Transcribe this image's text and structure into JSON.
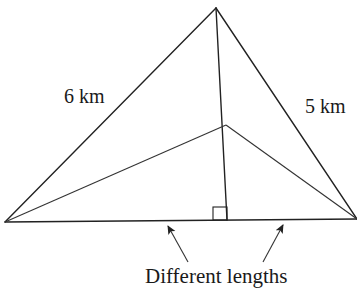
{
  "diagram": {
    "type": "geometry-triangle",
    "stroke_color": "#222222",
    "background": "#ffffff",
    "vertices": {
      "apex": [
        216,
        8
      ],
      "left": [
        5,
        222
      ],
      "right": [
        357,
        219
      ],
      "interior": [
        226,
        125
      ],
      "foot": [
        227,
        220
      ]
    },
    "labels": {
      "left_side": "6 km",
      "right_side": "5 km",
      "caption": "Different lengths"
    },
    "right_angle_marker": {
      "x": 213,
      "y": 207,
      "size": 14
    },
    "arrows": [
      {
        "from": [
          188,
          262
        ],
        "to": [
          168,
          226
        ]
      },
      {
        "from": [
          263,
          262
        ],
        "to": [
          283,
          225
        ]
      }
    ]
  }
}
